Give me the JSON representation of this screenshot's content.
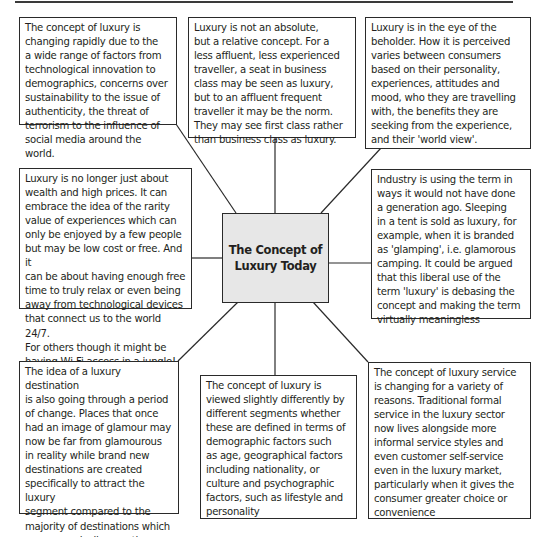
{
  "diagram": {
    "center": {
      "title": "The Concept of\nLuxury Today"
    },
    "boxes": {
      "top_left": "The concept of luxury is\nchanging rapidly due to the\na wide range of factors from\ntechnological innovation to\ndemographics, concerns over\nsustainability to the issue of\nauthenticity, the threat of\nterrorism to the influence of\nsocial media around the world.",
      "top_center": "Luxury is not an absolute,\nbut a relative concept. For a\nless affluent, less experienced\ntraveller, a seat in business\nclass may be seen as luxury,\nbut to an affluent frequent\ntraveller it may be the norm.\nThey may see first class rather\nthan business class as luxury.",
      "top_right": "Luxury is in the eye of the\nbeholder. How it is perceived\nvaries between consumers\nbased on their personality,\nexperiences, attitudes and\nmood, who they are travelling\nwith, the benefits they are\nseeking from the experience,\nand their 'world view'.",
      "middle_left": "Luxury is no longer just about\nwealth and high prices. It can\nembrace the idea of the rarity\nvalue of experiences which can\nonly be enjoyed by a few people\nbut may be low cost or free. And it\ncan be about having enough free\ntime to truly relax or even being\naway from technological devices\nthat connect us to the world 24/7.\nFor others though it might be\nhaving Wi-Fi access in a jungle!",
      "middle_right": "Industry is using the term in\nways it would not have done\na generation ago. Sleeping\nin a tent is sold as luxury, for\nexample, when it is branded\nas 'glamping', i.e. glamorous\ncamping. It could be argued\nthat this liberal use of the\nterm 'luxury' is debasing the\nconcept and making the term\nvirtually meaningless",
      "bottom_left": "The idea of a luxury destination\nis also going through a period\nof change. Places that once\nhad an image of glamour may\nnow be far from glamourous\nin reality while brand new\ndestinations are created\nspecifically to attract the luxury\nsegment compared to the\nmajority of destinations which\ngrew organically over time",
      "bottom_center": "The concept of luxury is\nviewed slightly differently by\ndifferent segments whether\nthese are defined in terms of\ndemographic factors such\nas age, geographical factors\nincluding nationality, or\nculture and psychographic\nfactors, such as lifestyle and\npersonality",
      "bottom_right": "The concept of luxury service\nis changing for a variety of\nreasons. Traditional formal\nservice in the luxury sector\nnow lives alongside more\ninformal service styles and\neven customer self-service\neven in the luxury market,\nparticularly when it gives the\nconsumer greater choice or\nconvenience"
    }
  },
  "colors": {
    "border": "#2a2a2a",
    "center_fill": "#e7e7e7",
    "text": "#231f20"
  }
}
